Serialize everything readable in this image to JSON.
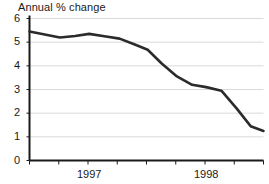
{
  "chart_data": {
    "type": "line",
    "title": "Annual % change",
    "xlabel": "",
    "ylabel": "",
    "ylim": [
      0,
      6
    ],
    "yticks": [
      0,
      1,
      2,
      3,
      4,
      5,
      6
    ],
    "ytick_labels": [
      "0",
      "1",
      "2",
      "3",
      "4",
      "5",
      "6"
    ],
    "xtick_labels": [
      "1997",
      "1998"
    ],
    "xtick_label_positions": [
      0.255,
      0.755
    ],
    "xtick_count": 9,
    "grid": "horizontal",
    "legend": "none",
    "line_color": "#2b2b2b",
    "grid_color": "#d9d9d9",
    "axis_color": "#1a1a1a",
    "x": [
      0.0,
      0.065,
      0.13,
      0.195,
      0.255,
      0.32,
      0.385,
      0.45,
      0.505,
      0.565,
      0.63,
      0.695,
      0.755,
      0.82,
      0.885,
      0.945,
      1.0
    ],
    "values": [
      5.45,
      5.32,
      5.2,
      5.26,
      5.35,
      5.25,
      5.15,
      4.9,
      4.68,
      4.1,
      3.55,
      3.2,
      3.1,
      2.95,
      2.2,
      1.45,
      1.25
    ]
  }
}
